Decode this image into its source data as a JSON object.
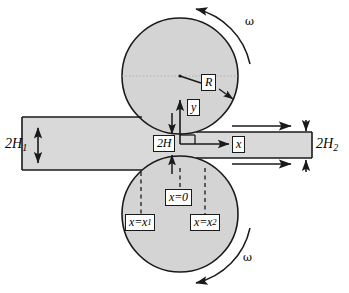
{
  "figure": {
    "type": "technical-diagram",
    "colors": {
      "roll_fill": "#d4d4d4",
      "strip_fill": "#d9d9d9",
      "outline": "#1a1a1a",
      "background": "#ffffff",
      "dashed_line": "#1a1a1a"
    },
    "labels": {
      "radius": "R",
      "y_axis": "y",
      "x_axis": "x",
      "gap_thickness": "2H",
      "entry_thickness_prefix": "2H",
      "entry_thickness_sub": "1",
      "exit_thickness_prefix": "2H",
      "exit_thickness_sub": "2",
      "origin_station": "x=0",
      "station_one_prefix": "x=x",
      "station_one_sub": "1",
      "station_two_prefix": "x=x",
      "station_two_sub": "2",
      "omega_top": "ω",
      "omega_bottom": "ω"
    },
    "geometry": {
      "top_roll": {
        "cx": 180,
        "cy": 76,
        "r": 58
      },
      "bottom_roll": {
        "cx": 180,
        "cy": 214,
        "r": 58
      },
      "strip_in": {
        "x": 22,
        "y": 117,
        "w": 158,
        "h": 53
      },
      "strip_out": {
        "x": 180,
        "y": 132,
        "w": 132,
        "h": 26
      },
      "roll_gap_center": {
        "x": 180,
        "y": 144
      },
      "station_x1": 141,
      "station_x0": 180,
      "station_x2": 205
    }
  }
}
